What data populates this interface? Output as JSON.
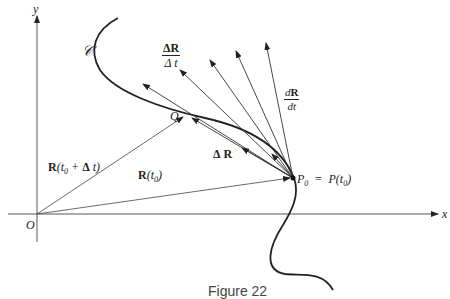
{
  "figure": {
    "caption": "Figure 22",
    "axes": {
      "x_label": "x",
      "y_label": "y",
      "origin_label": "O"
    },
    "curve_label": "𝒞",
    "point_Q": "Q",
    "point_P0": {
      "name": "P",
      "sub": "0",
      "eq": "=",
      "func": "P(t",
      "func_sub": "0",
      "close": ")"
    },
    "vectors": {
      "R_t0": {
        "bold": "R",
        "open": "(t",
        "sub": "0",
        "close": ")"
      },
      "R_t0_dt": {
        "bold": "R",
        "open": "(t",
        "sub": "0",
        "mid": " + ",
        "delta": "Δ",
        "tail": " t)"
      },
      "delta_R": {
        "delta": "Δ",
        "bold": "R"
      },
      "dR_over_dt_diff": {
        "num_d": "Δ",
        "num_R": "R",
        "den": "Δ t"
      },
      "derivative": {
        "num_d": "d",
        "num_R": "R",
        "den": "dt"
      }
    }
  }
}
